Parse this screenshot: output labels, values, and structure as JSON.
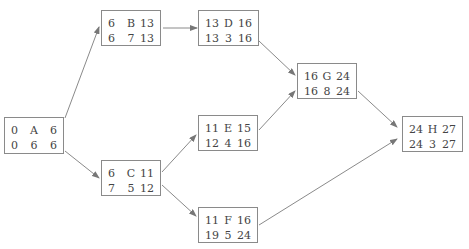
{
  "diagram": {
    "type": "activity-on-node network",
    "nodes": {
      "A": {
        "es": "0",
        "name": "A",
        "ef": "6",
        "ls": "0",
        "dur": "6",
        "lf": "6"
      },
      "B": {
        "es": "6",
        "name": "B",
        "ef": "13",
        "ls": "6",
        "dur": "7",
        "lf": "13"
      },
      "C": {
        "es": "6",
        "name": "C",
        "ef": "11",
        "ls": "7",
        "dur": "5",
        "lf": "12"
      },
      "D": {
        "es": "13",
        "name": "D",
        "ef": "16",
        "ls": "13",
        "dur": "3",
        "lf": "16"
      },
      "E": {
        "es": "11",
        "name": "E",
        "ef": "15",
        "ls": "12",
        "dur": "4",
        "lf": "16"
      },
      "F": {
        "es": "11",
        "name": "F",
        "ef": "16",
        "ls": "19",
        "dur": "5",
        "lf": "24"
      },
      "G": {
        "es": "16",
        "name": "G",
        "ef": "24",
        "ls": "16",
        "dur": "8",
        "lf": "24"
      },
      "H": {
        "es": "24",
        "name": "H",
        "ef": "27",
        "ls": "24",
        "dur": "3",
        "lf": "27"
      }
    },
    "edges": [
      [
        "A",
        "B"
      ],
      [
        "A",
        "C"
      ],
      [
        "B",
        "D"
      ],
      [
        "C",
        "E"
      ],
      [
        "C",
        "F"
      ],
      [
        "D",
        "G"
      ],
      [
        "E",
        "G"
      ],
      [
        "G",
        "H"
      ],
      [
        "F",
        "H"
      ]
    ]
  }
}
